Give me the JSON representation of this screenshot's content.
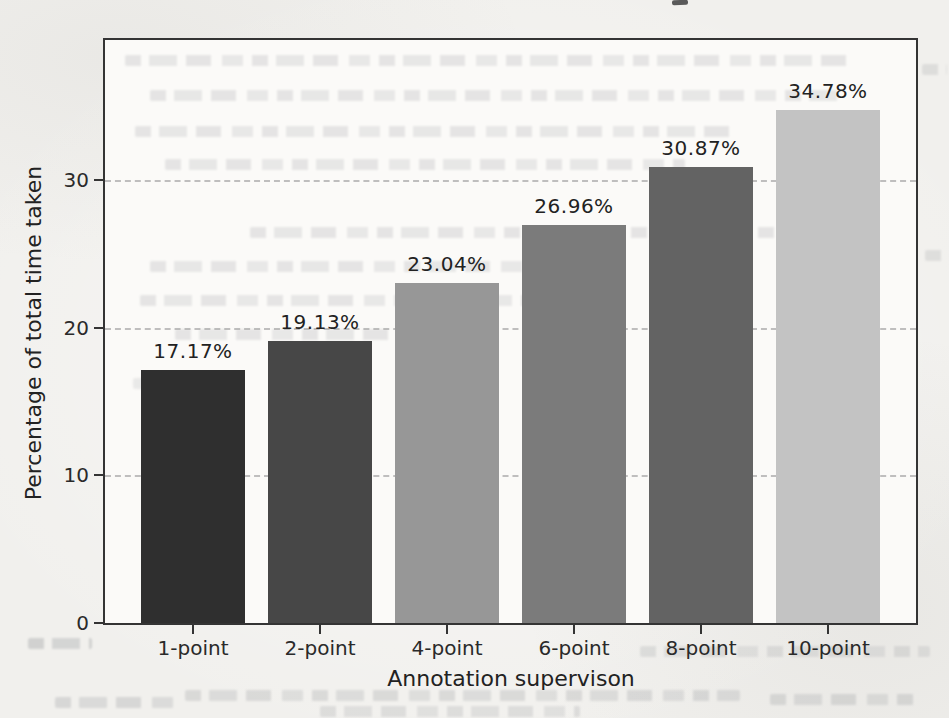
{
  "page": {
    "kind": "scanned paper page with figure",
    "background_color": "#f1f0ed"
  },
  "figure": {
    "plot_background": "#fbfaf8",
    "frame_color": "#343434",
    "gridline_color": "#ababab",
    "text_color": "#222222"
  },
  "chart_data": {
    "type": "bar",
    "title": "",
    "xlabel": "Annotation supervison",
    "ylabel": "Percentage of total time taken",
    "categories": [
      "1-point",
      "2-point",
      "4-point",
      "6-point",
      "8-point",
      "10-point"
    ],
    "values": [
      17.17,
      19.13,
      23.04,
      26.96,
      30.87,
      34.78
    ],
    "bar_labels": [
      "17.17%",
      "19.13%",
      "23.04%",
      "26.96%",
      "30.87%",
      "34.78%"
    ],
    "bar_colors": [
      "#2f2f2f",
      "#474747",
      "#979797",
      "#7b7b7b",
      "#636363",
      "#c3c3c3"
    ],
    "ylim": [
      0,
      39.5
    ],
    "yticks": [
      0,
      10,
      20,
      30
    ],
    "ytick_labels": [
      "0",
      "10",
      "20",
      "30"
    ],
    "grid": "horizontal dashed lines at y ticks",
    "legend": "none"
  }
}
